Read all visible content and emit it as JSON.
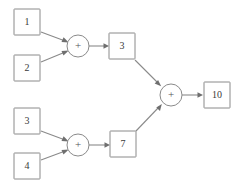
{
  "diagram": {
    "type": "flow-graph",
    "colors": {
      "stroke": "#8a8a8a",
      "arrowhead": "#6f6f6f",
      "text": "#3a3a3a",
      "background": "#ffffff"
    },
    "nodes": [
      {
        "id": "in1",
        "shape": "box",
        "label": "1",
        "x": 27,
        "y": 22
      },
      {
        "id": "in2",
        "shape": "box",
        "label": "2",
        "x": 27,
        "y": 68
      },
      {
        "id": "op1",
        "shape": "circle",
        "label": "+",
        "x": 78,
        "y": 46
      },
      {
        "id": "sum1",
        "shape": "box",
        "label": "3",
        "x": 122,
        "y": 46
      },
      {
        "id": "in3",
        "shape": "box",
        "label": "3",
        "x": 27,
        "y": 121
      },
      {
        "id": "in4",
        "shape": "box",
        "label": "4",
        "x": 27,
        "y": 166
      },
      {
        "id": "op2",
        "shape": "circle",
        "label": "+",
        "x": 78,
        "y": 145
      },
      {
        "id": "sum2",
        "shape": "box",
        "label": "7",
        "x": 123,
        "y": 144
      },
      {
        "id": "op3",
        "shape": "circle",
        "label": "+",
        "x": 171,
        "y": 95
      },
      {
        "id": "out",
        "shape": "box",
        "label": "10",
        "x": 217,
        "y": 95
      }
    ],
    "edges": [
      {
        "from": "in1",
        "to": "op1"
      },
      {
        "from": "in2",
        "to": "op1"
      },
      {
        "from": "op1",
        "to": "sum1"
      },
      {
        "from": "in3",
        "to": "op2"
      },
      {
        "from": "in4",
        "to": "op2"
      },
      {
        "from": "op2",
        "to": "sum2"
      },
      {
        "from": "sum1",
        "to": "op3"
      },
      {
        "from": "sum2",
        "to": "op3"
      },
      {
        "from": "op3",
        "to": "out"
      }
    ],
    "geometry": {
      "box_width": 26,
      "box_height": 26,
      "circle_radius": 11
    }
  }
}
